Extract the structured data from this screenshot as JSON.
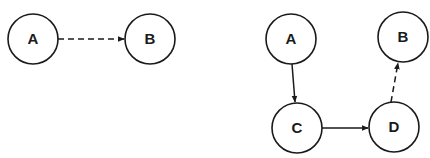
{
  "colors": {
    "stroke": "#1a1a1a",
    "background": "#ffffff"
  },
  "diagrams": [
    {
      "name": "left-diagram",
      "nodes": [
        {
          "id": "A",
          "label": "A",
          "cx": 33,
          "cy": 39,
          "r": 25
        },
        {
          "id": "B",
          "label": "B",
          "cx": 150,
          "cy": 39,
          "r": 25
        }
      ],
      "edges": [
        {
          "from": "A",
          "to": "B",
          "style": "dashed",
          "x1": 58,
          "y1": 39,
          "x2": 124,
          "y2": 39
        }
      ]
    },
    {
      "name": "right-diagram",
      "nodes": [
        {
          "id": "A",
          "label": "A",
          "cx": 291,
          "cy": 39,
          "r": 25
        },
        {
          "id": "B",
          "label": "B",
          "cx": 403,
          "cy": 37,
          "r": 25
        },
        {
          "id": "C",
          "label": "C",
          "cx": 297,
          "cy": 128,
          "r": 25
        },
        {
          "id": "D",
          "label": "D",
          "cx": 394,
          "cy": 127,
          "r": 25
        }
      ],
      "edges": [
        {
          "from": "A",
          "to": "C",
          "style": "solid",
          "x1": 292,
          "y1": 64,
          "x2": 295,
          "y2": 102
        },
        {
          "from": "C",
          "to": "D",
          "style": "solid",
          "x1": 322,
          "y1": 128,
          "x2": 368,
          "y2": 128
        },
        {
          "from": "D",
          "to": "B",
          "style": "dashed",
          "x1": 391,
          "y1": 102,
          "x2": 398,
          "y2": 63
        }
      ]
    }
  ]
}
